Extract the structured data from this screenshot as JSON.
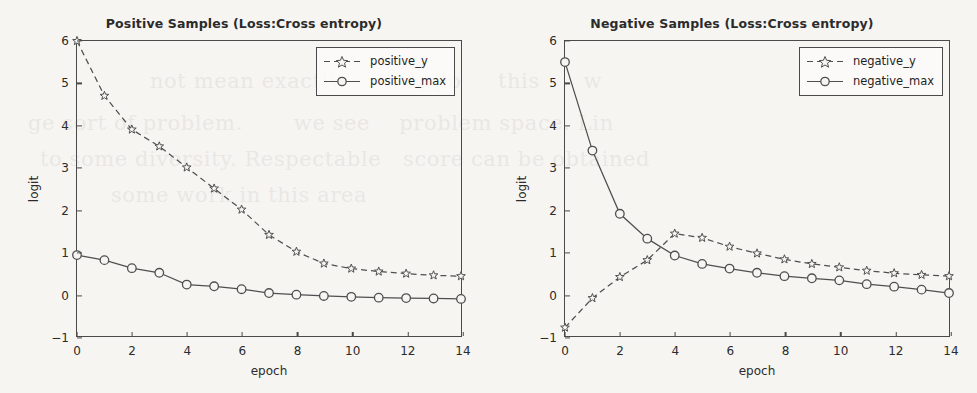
{
  "page": {
    "background_color": "#f6f5f2",
    "ghost_text": [
      "not mean exactly         oppo     this      w",
      "ge sort of problem.       we see    problem space. Lin",
      "to some diversity. Respectable   score can be obtained",
      "       some work in this area"
    ]
  },
  "axis": {
    "xlabel": "epoch",
    "ylabel": "logit",
    "xticks": [
      0,
      2,
      4,
      6,
      8,
      10,
      12,
      14
    ],
    "yticks": [
      -1,
      0,
      1,
      2,
      3,
      4,
      5,
      6
    ],
    "xlim": [
      0,
      14
    ],
    "ylim": [
      -1,
      6
    ]
  },
  "style": {
    "line_color": "#4f4f4f",
    "frame_color": "#4a4a4a",
    "text_color": "#2b2b2b"
  },
  "chart_data": [
    {
      "type": "line",
      "title": "Positive Samples (Loss:Cross entropy)",
      "xlabel": "epoch",
      "ylabel": "logit",
      "xlim": [
        0,
        14
      ],
      "ylim": [
        -1,
        6
      ],
      "grid": false,
      "legend_position": "upper right",
      "x": [
        0,
        1,
        2,
        3,
        4,
        5,
        6,
        7,
        8,
        9,
        10,
        11,
        12,
        13,
        14
      ],
      "series": [
        {
          "name": "positive_y",
          "linestyle": "dashed",
          "marker": "star",
          "values": [
            6.0,
            4.7,
            3.9,
            3.5,
            3.0,
            2.5,
            2.0,
            1.4,
            1.0,
            0.72,
            0.6,
            0.53,
            0.48,
            0.44,
            0.42
          ]
        },
        {
          "name": "positive_max",
          "linestyle": "solid",
          "marker": "circle",
          "values": [
            0.92,
            0.8,
            0.61,
            0.5,
            0.22,
            0.18,
            0.11,
            0.02,
            -0.02,
            -0.05,
            -0.07,
            -0.09,
            -0.1,
            -0.11,
            -0.12
          ]
        }
      ]
    },
    {
      "type": "line",
      "title": "Negative Samples (Loss:Cross entropy)",
      "xlabel": "epoch",
      "ylabel": "logit",
      "xlim": [
        0,
        14
      ],
      "ylim": [
        -1,
        6
      ],
      "grid": false,
      "legend_position": "upper right",
      "x": [
        0,
        1,
        2,
        3,
        4,
        5,
        6,
        7,
        8,
        9,
        10,
        11,
        12,
        13,
        14
      ],
      "series": [
        {
          "name": "negative_y",
          "linestyle": "dashed",
          "marker": "star",
          "values": [
            -0.8,
            -0.1,
            0.4,
            0.8,
            1.43,
            1.33,
            1.12,
            0.96,
            0.82,
            0.71,
            0.63,
            0.55,
            0.49,
            0.45,
            0.42
          ]
        },
        {
          "name": "negative_max",
          "linestyle": "solid",
          "marker": "circle",
          "values": [
            5.5,
            3.4,
            1.9,
            1.31,
            0.91,
            0.71,
            0.6,
            0.5,
            0.42,
            0.37,
            0.32,
            0.23,
            0.17,
            0.1,
            0.02
          ]
        }
      ]
    }
  ]
}
